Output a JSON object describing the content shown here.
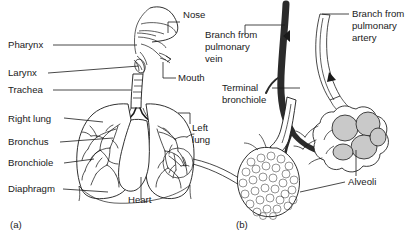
{
  "figure": {
    "background": "#ffffff",
    "ink": "#1a1a1a",
    "fill_grey": "#c9c9c9"
  },
  "panels": [
    {
      "id": "a",
      "marker": "(a)",
      "caption": "Respiratory tract and lungs"
    },
    {
      "id": "b",
      "marker": "(b)",
      "caption": "Terminal bronchiole and alveoli"
    }
  ],
  "panel_a": {
    "labels": [
      {
        "name": "pharynx",
        "text": "Pharynx",
        "x": 8,
        "y": 48
      },
      {
        "name": "larynx",
        "text": "Larynx",
        "x": 8,
        "y": 76
      },
      {
        "name": "trachea",
        "text": "Trachea",
        "x": 8,
        "y": 93
      },
      {
        "name": "right-lung",
        "text": "Right lung",
        "x": 8,
        "y": 122
      },
      {
        "name": "bronchus",
        "text": "Bronchus",
        "x": 8,
        "y": 145
      },
      {
        "name": "bronchiole",
        "text": "Bronchiole",
        "x": 8,
        "y": 166
      },
      {
        "name": "diaphragm",
        "text": "Diaphragm",
        "x": 8,
        "y": 192
      },
      {
        "name": "nose",
        "text": "Nose",
        "x": 183,
        "y": 18
      },
      {
        "name": "mouth",
        "text": "Mouth",
        "x": 178,
        "y": 81
      },
      {
        "name": "heart",
        "text": "Heart",
        "x": 128,
        "y": 203
      }
    ],
    "left_lung_label": {
      "name": "left-lung",
      "line1": "Left",
      "line2": "lung",
      "x": 192,
      "y": 131
    },
    "marker": "(a)"
  },
  "panel_b": {
    "vein_label": {
      "name": "branch-from-pulmonary-vein",
      "line1": "Branch from",
      "line2": "pulmonary",
      "line3": "vein",
      "x": 205,
      "y": 38
    },
    "artery_label": {
      "name": "branch-from-pulmonary-artery",
      "line1": "Branch from",
      "line2": "pulmonary",
      "line3": "artery",
      "x": 352,
      "y": 17
    },
    "bronchiole_label": {
      "name": "terminal-bronchiole",
      "line1": "Terminal",
      "line2": "bronchiole",
      "x": 222,
      "y": 91
    },
    "alveoli_label": {
      "name": "alveoli",
      "text": "Alveoli",
      "x": 348,
      "y": 185
    },
    "marker": "(b)"
  }
}
